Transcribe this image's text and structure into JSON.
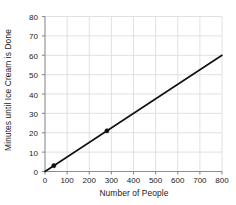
{
  "chart_data": {
    "type": "line",
    "title": "",
    "xlabel": "Number of People",
    "ylabel": "Minutes until Ice Cream is Done",
    "xlim": [
      0,
      800
    ],
    "ylim": [
      0,
      80
    ],
    "xticks": [
      0,
      100,
      200,
      300,
      400,
      500,
      600,
      700,
      800
    ],
    "yticks": [
      0,
      10,
      20,
      30,
      40,
      50,
      60,
      70,
      80
    ],
    "grid": true,
    "legend": "none",
    "series": [
      {
        "name": "Ice cream serving time",
        "x": [
          0,
          800
        ],
        "y": [
          0,
          60
        ],
        "slope": 0.075,
        "intercept": 0,
        "line_color": "#111111",
        "marker_points": [
          {
            "x": 40,
            "y": 3
          },
          {
            "x": 280,
            "y": 21
          }
        ],
        "marker_color": "#111111"
      }
    ]
  },
  "axes": {
    "axis_color": "#8c8c8c",
    "grid_color": "#d9d9d9",
    "background": "#ffffff"
  }
}
